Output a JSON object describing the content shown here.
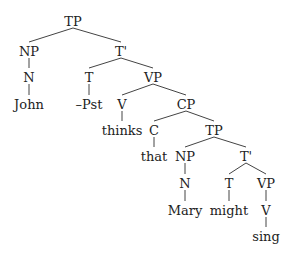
{
  "diagram": {
    "type": "syntax-tree",
    "nodes": [
      {
        "id": "tp1",
        "label": "TP",
        "x": 73,
        "y": 22
      },
      {
        "id": "np1",
        "label": "NP",
        "x": 29,
        "y": 52
      },
      {
        "id": "tbar1",
        "label": "T'",
        "x": 121,
        "y": 52
      },
      {
        "id": "n1",
        "label": "N",
        "x": 29,
        "y": 78
      },
      {
        "id": "john",
        "label": "John",
        "x": 29,
        "y": 105
      },
      {
        "id": "t1",
        "label": "T",
        "x": 89,
        "y": 78
      },
      {
        "id": "pst",
        "label": "–Pst",
        "x": 89,
        "y": 105
      },
      {
        "id": "vp1",
        "label": "VP",
        "x": 153,
        "y": 78
      },
      {
        "id": "v1",
        "label": "V",
        "x": 122,
        "y": 105
      },
      {
        "id": "thinks",
        "label": "thinks",
        "x": 122,
        "y": 131
      },
      {
        "id": "cp",
        "label": "CP",
        "x": 186,
        "y": 105
      },
      {
        "id": "c",
        "label": "C",
        "x": 154,
        "y": 131
      },
      {
        "id": "that",
        "label": "that",
        "x": 154,
        "y": 157
      },
      {
        "id": "tp2",
        "label": "TP",
        "x": 214,
        "y": 131
      },
      {
        "id": "np2",
        "label": "NP",
        "x": 185,
        "y": 157
      },
      {
        "id": "n2",
        "label": "N",
        "x": 185,
        "y": 184
      },
      {
        "id": "mary",
        "label": "Mary",
        "x": 185,
        "y": 211
      },
      {
        "id": "tbar2",
        "label": "T'",
        "x": 246,
        "y": 157
      },
      {
        "id": "t2",
        "label": "T",
        "x": 229,
        "y": 184
      },
      {
        "id": "might",
        "label": "might",
        "x": 229,
        "y": 211
      },
      {
        "id": "vp2",
        "label": "VP",
        "x": 266,
        "y": 184
      },
      {
        "id": "v2",
        "label": "V",
        "x": 266,
        "y": 211
      },
      {
        "id": "sing",
        "label": "sing",
        "x": 266,
        "y": 237
      }
    ],
    "edges": [
      [
        "tp1",
        "np1"
      ],
      [
        "tp1",
        "tbar1"
      ],
      [
        "np1",
        "n1"
      ],
      [
        "n1",
        "john"
      ],
      [
        "tbar1",
        "t1"
      ],
      [
        "tbar1",
        "vp1"
      ],
      [
        "t1",
        "pst"
      ],
      [
        "vp1",
        "v1"
      ],
      [
        "vp1",
        "cp"
      ],
      [
        "v1",
        "thinks"
      ],
      [
        "cp",
        "c"
      ],
      [
        "cp",
        "tp2"
      ],
      [
        "c",
        "that"
      ],
      [
        "tp2",
        "np2"
      ],
      [
        "tp2",
        "tbar2"
      ],
      [
        "np2",
        "n2"
      ],
      [
        "n2",
        "mary"
      ],
      [
        "tbar2",
        "t2"
      ],
      [
        "tbar2",
        "vp2"
      ],
      [
        "t2",
        "might"
      ],
      [
        "vp2",
        "v2"
      ],
      [
        "v2",
        "sing"
      ]
    ]
  }
}
